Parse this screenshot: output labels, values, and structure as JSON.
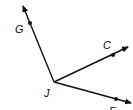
{
  "diagram": {
    "type": "geometry-rays",
    "vertex": {
      "label": "J",
      "x": 54,
      "y": 82
    },
    "rays": [
      {
        "name": "ray-JG",
        "point_label": "G",
        "point": {
          "x": 30,
          "y": 23
        },
        "tip": {
          "x": 22,
          "y": 4
        }
      },
      {
        "name": "ray-JC",
        "point_label": "C",
        "point": {
          "x": 113,
          "y": 55
        },
        "tip": {
          "x": 130,
          "y": 46
        }
      },
      {
        "name": "ray-JE",
        "point_label": "E",
        "point": {
          "x": 116,
          "y": 99
        },
        "tip": {
          "x": 133,
          "y": 104
        }
      }
    ],
    "labels": {
      "G": "G",
      "C": "C",
      "J": "J",
      "E": "E"
    },
    "colors": {
      "stroke": "#111111",
      "background": "#ffffff"
    }
  }
}
